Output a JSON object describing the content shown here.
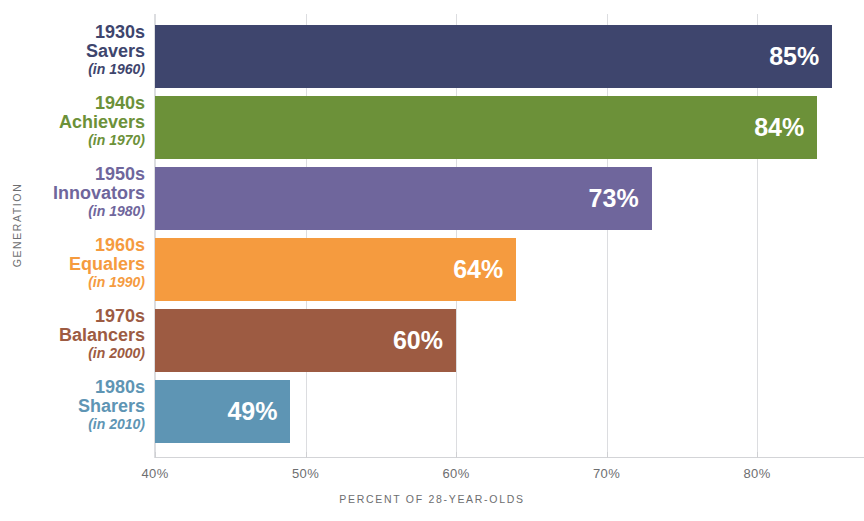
{
  "chart_data": {
    "type": "bar",
    "orientation": "horizontal",
    "title": "",
    "xlabel": "PERCENT OF 28-YEAR-OLDS",
    "ylabel": "GENERATION",
    "xlim": [
      40,
      85.5
    ],
    "grid": true,
    "legend": "none",
    "xticks": [
      "40%",
      "50%",
      "60%",
      "70%",
      "80%"
    ],
    "xtick_values": [
      40,
      50,
      60,
      70,
      80
    ],
    "categories": [
      "1930s Savers (in 1960)",
      "1940s Achievers (in 1970)",
      "1950s Innovators (in 1980)",
      "1960s Equalers (in 1990)",
      "1970s Balancers (in 2000)",
      "1980s Sharers (in 2010)"
    ],
    "values": [
      85,
      84,
      73,
      64,
      60,
      49
    ],
    "value_labels": [
      "85%",
      "84%",
      "73%",
      "64%",
      "60%",
      "49%"
    ],
    "colors": [
      "#3e456d",
      "#6c9139",
      "#6f669c",
      "#f59b3f",
      "#9d5b42",
      "#5e95b4"
    ]
  },
  "bars": [
    {
      "decade": "1930s",
      "name": "Savers",
      "year": "(in 1960)",
      "value_label": "85%",
      "value": 85,
      "color": "#3e456d"
    },
    {
      "decade": "1940s",
      "name": "Achievers",
      "year": "(in 1970)",
      "value_label": "84%",
      "value": 84,
      "color": "#6c9139"
    },
    {
      "decade": "1950s",
      "name": "Innovators",
      "year": "(in 1980)",
      "value_label": "73%",
      "value": 73,
      "color": "#6f669c"
    },
    {
      "decade": "1960s",
      "name": "Equalers",
      "year": "(in 1990)",
      "value_label": "64%",
      "value": 64,
      "color": "#f59b3f"
    },
    {
      "decade": "1970s",
      "name": "Balancers",
      "year": "(in 2000)",
      "value_label": "60%",
      "value": 60,
      "color": "#9d5b42"
    },
    {
      "decade": "1980s",
      "name": "Sharers",
      "year": "(in 2010)",
      "value_label": "49%",
      "value": 49,
      "color": "#5e95b4"
    }
  ],
  "axes": {
    "y_title": "GENERATION",
    "x_title": "PERCENT OF 28-YEAR-OLDS",
    "x_ticks": [
      "40%",
      "50%",
      "60%",
      "70%",
      "80%"
    ]
  },
  "style": {
    "gridline_color": "#dcdde0",
    "axis_text_color": "#6d6e70",
    "value_text_color": "#ffffff",
    "background": "#ffffff"
  }
}
